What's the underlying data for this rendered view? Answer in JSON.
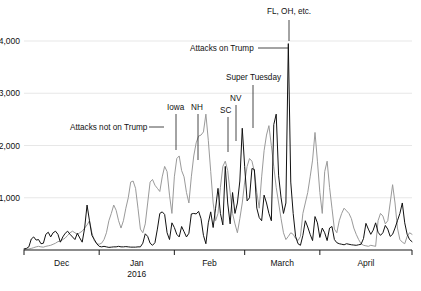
{
  "chart_data": {
    "type": "line",
    "title": "",
    "subtitle": "",
    "xlabel": "",
    "ylabel": "",
    "ylim": [
      0,
      4400
    ],
    "xlim": [
      0,
      160
    ],
    "grid": true,
    "legend_position": "inline-annotations",
    "y_ticks": [
      {
        "value": 1000,
        "label": "1,000"
      },
      {
        "value": 2000,
        "label": "2,000"
      },
      {
        "value": 3000,
        "label": "3,000"
      },
      {
        "value": 4000,
        "label": "4,000"
      }
    ],
    "x_ticks": [
      {
        "value": 0,
        "label": "Dec",
        "sublabel": ""
      },
      {
        "value": 31,
        "label": "Jan",
        "sublabel": "2016"
      },
      {
        "value": 62,
        "label": "Feb",
        "sublabel": ""
      },
      {
        "value": 91,
        "label": "March",
        "sublabel": ""
      },
      {
        "value": 122,
        "label": "April",
        "sublabel": ""
      }
    ],
    "colors": {
      "attacks_on_trump": "#111111",
      "attacks_not_on_trump": "#9a9a9a",
      "gridline": "#d6d6d6",
      "axis": "#1a1a1a"
    },
    "series": [
      {
        "name": "Attacks on Trump",
        "color": "#111111",
        "values": [
          20,
          30,
          60,
          210,
          250,
          190,
          200,
          120,
          130,
          300,
          340,
          250,
          330,
          360,
          300,
          150,
          250,
          320,
          360,
          300,
          250,
          200,
          320,
          230,
          150,
          420,
          860,
          560,
          280,
          200,
          120,
          70,
          60,
          70,
          60,
          50,
          55,
          60,
          60,
          70,
          60,
          60,
          65,
          60,
          55,
          55,
          55,
          60,
          60,
          130,
          310,
          260,
          130,
          90,
          140,
          400,
          700,
          730,
          680,
          330,
          200,
          520,
          430,
          300,
          250,
          450,
          350,
          250,
          320,
          690,
          700,
          690,
          740,
          600,
          280,
          120,
          520,
          730,
          430,
          800,
          1180,
          700,
          480,
          1600,
          900,
          500,
          1100,
          700,
          900,
          1320,
          2330,
          1600,
          940,
          1000,
          1560,
          1540,
          800,
          620,
          560,
          1050,
          900,
          700,
          560,
          2400,
          2600,
          1420,
          1000,
          700,
          900,
          3950,
          1300,
          700,
          260,
          120,
          90,
          280,
          560,
          440,
          300,
          180,
          640,
          520,
          240,
          420,
          330,
          180,
          420,
          450,
          200,
          140,
          120,
          110,
          100,
          120,
          110,
          100,
          95,
          90,
          100,
          110,
          220,
          510,
          400,
          300,
          380,
          520,
          340,
          280,
          330,
          470,
          400,
          260,
          300,
          420,
          560,
          700,
          900,
          520,
          300,
          200,
          160
        ]
      },
      {
        "name": "Attacks not on Trump",
        "color": "#9a9a9a",
        "values": [
          10,
          15,
          20,
          30,
          45,
          60,
          70,
          60,
          55,
          70,
          80,
          90,
          110,
          130,
          160,
          170,
          200,
          230,
          280,
          330,
          360,
          330,
          300,
          330,
          360,
          420,
          480,
          560,
          330,
          180,
          120,
          110,
          130,
          200,
          330,
          560,
          700,
          860,
          760,
          560,
          420,
          560,
          800,
          1000,
          1300,
          1320,
          1180,
          800,
          400,
          330,
          500,
          900,
          1300,
          1350,
          1240,
          1180,
          1120,
          1400,
          1600,
          1500,
          1050,
          700,
          1400,
          1750,
          1800,
          1520,
          1400,
          1100,
          900,
          1400,
          1800,
          2050,
          2180,
          2200,
          2260,
          2600,
          2100,
          1500,
          900,
          560,
          700,
          1200,
          1600,
          1700,
          1520,
          1100,
          700,
          500,
          330,
          600,
          900,
          1300,
          1600,
          1750,
          1700,
          1500,
          1100,
          800,
          1400,
          1900,
          2200,
          2380,
          2000,
          1600,
          1200,
          900,
          600,
          330,
          200,
          260,
          330,
          300,
          220,
          180,
          260,
          700,
          900,
          1100,
          1400,
          1720,
          2250,
          1700,
          1100,
          700,
          1500,
          1700,
          1200,
          800,
          400,
          330,
          560,
          700,
          800,
          750,
          700,
          600,
          420,
          300,
          200,
          120,
          90,
          80,
          70,
          90,
          80,
          70,
          560,
          700,
          650,
          500,
          560,
          900,
          1250,
          900,
          420,
          200,
          150,
          120,
          260,
          330,
          300
        ]
      }
    ],
    "annotations": [
      {
        "id": "fl-oh-etc",
        "label": "FL, OH, etc.",
        "label_x": 267,
        "label_y": 14,
        "leader": {
          "type": "vertical",
          "x": 289,
          "y1": 20,
          "y2": 41
        }
      },
      {
        "id": "attacks-on-trump",
        "label": "Attacks on Trump",
        "label_x": 190,
        "label_y": 51,
        "leader": {
          "type": "horizontal",
          "y": 48,
          "x1": 258,
          "x2": 289
        }
      },
      {
        "id": "super-tuesday",
        "label": "Super Tuesday",
        "label_x": 226,
        "label_y": 80,
        "leader": {
          "type": "vertical",
          "x": 253,
          "y1": 85,
          "y2": 128
        }
      },
      {
        "id": "nv",
        "label": "NV",
        "label_x": 230,
        "label_y": 101,
        "leader": {
          "type": "vertical",
          "x": 236,
          "y1": 105,
          "y2": 141
        }
      },
      {
        "id": "sc",
        "label": "SC",
        "label_x": 220,
        "label_y": 113,
        "leader": {
          "type": "vertical",
          "x": 228,
          "y1": 117,
          "y2": 152
        }
      },
      {
        "id": "iowa",
        "label": "Iowa",
        "label_x": 167,
        "label_y": 110,
        "leader": {
          "type": "vertical",
          "x": 176,
          "y1": 114,
          "y2": 150
        }
      },
      {
        "id": "nh",
        "label": "NH",
        "label_x": 191,
        "label_y": 110,
        "leader": {
          "type": "vertical",
          "x": 198,
          "y1": 114,
          "y2": 160
        }
      },
      {
        "id": "attacks-not-on-trump",
        "label": "Attacks not on Trump",
        "label_x": 70,
        "label_y": 130,
        "leader": {
          "type": "horizontal",
          "y": 127,
          "x1": 149,
          "x2": 164
        }
      }
    ]
  }
}
